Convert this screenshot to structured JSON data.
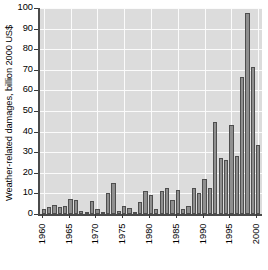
{
  "chart_data": {
    "type": "bar",
    "title": "",
    "subtitle": "",
    "xlabel": "",
    "ylabel": "Weather-related damages, billion 2000 US$",
    "xlim": [
      1959.3,
      2000.7
    ],
    "ylim": [
      0,
      100
    ],
    "ytick_labels": [
      "0",
      "10",
      "20",
      "30",
      "40",
      "50",
      "60",
      "70",
      "80",
      "90",
      "100"
    ],
    "ytick_values": [
      0,
      10,
      20,
      30,
      40,
      50,
      60,
      70,
      80,
      90,
      100
    ],
    "xtick_labels": [
      "1960",
      "1965",
      "1970",
      "1975",
      "1980",
      "1985",
      "1990",
      "1995",
      "2000"
    ],
    "xtick_values": [
      1960,
      1965,
      1970,
      1975,
      1980,
      1985,
      1990,
      1995,
      2000
    ],
    "grid": true,
    "legend": null,
    "bar_fill_color": "#8f8f8f",
    "bar_edge_color": "#4e4e4e",
    "plot_background_color": "#dcdcdc",
    "gridline_color": "#fbfbfb",
    "axis_color": "#4a4a4a",
    "categories": [
      1960,
      1961,
      1962,
      1963,
      1964,
      1965,
      1966,
      1967,
      1968,
      1969,
      1970,
      1971,
      1972,
      1973,
      1974,
      1975,
      1976,
      1977,
      1978,
      1979,
      1980,
      1981,
      1982,
      1983,
      1984,
      1985,
      1986,
      1987,
      1988,
      1989,
      1990,
      1991,
      1992,
      1993,
      1994,
      1995,
      1996,
      1997,
      1998,
      1999,
      2000
    ],
    "values": [
      2.2,
      3.5,
      4.5,
      3.3,
      4.0,
      7.5,
      7.0,
      1.3,
      0.6,
      6.5,
      2.3,
      0.5,
      10.3,
      15.0,
      1.7,
      4.0,
      2.8,
      0.7,
      6.0,
      11.0,
      9.0,
      2.5,
      11.0,
      12.5,
      7.0,
      11.5,
      2.5,
      4.0,
      12.5,
      10.0,
      17.0,
      12.5,
      44.5,
      27.0,
      26.0,
      43.0,
      28.0,
      66.5,
      97.5,
      71.5,
      33.5
    ]
  }
}
